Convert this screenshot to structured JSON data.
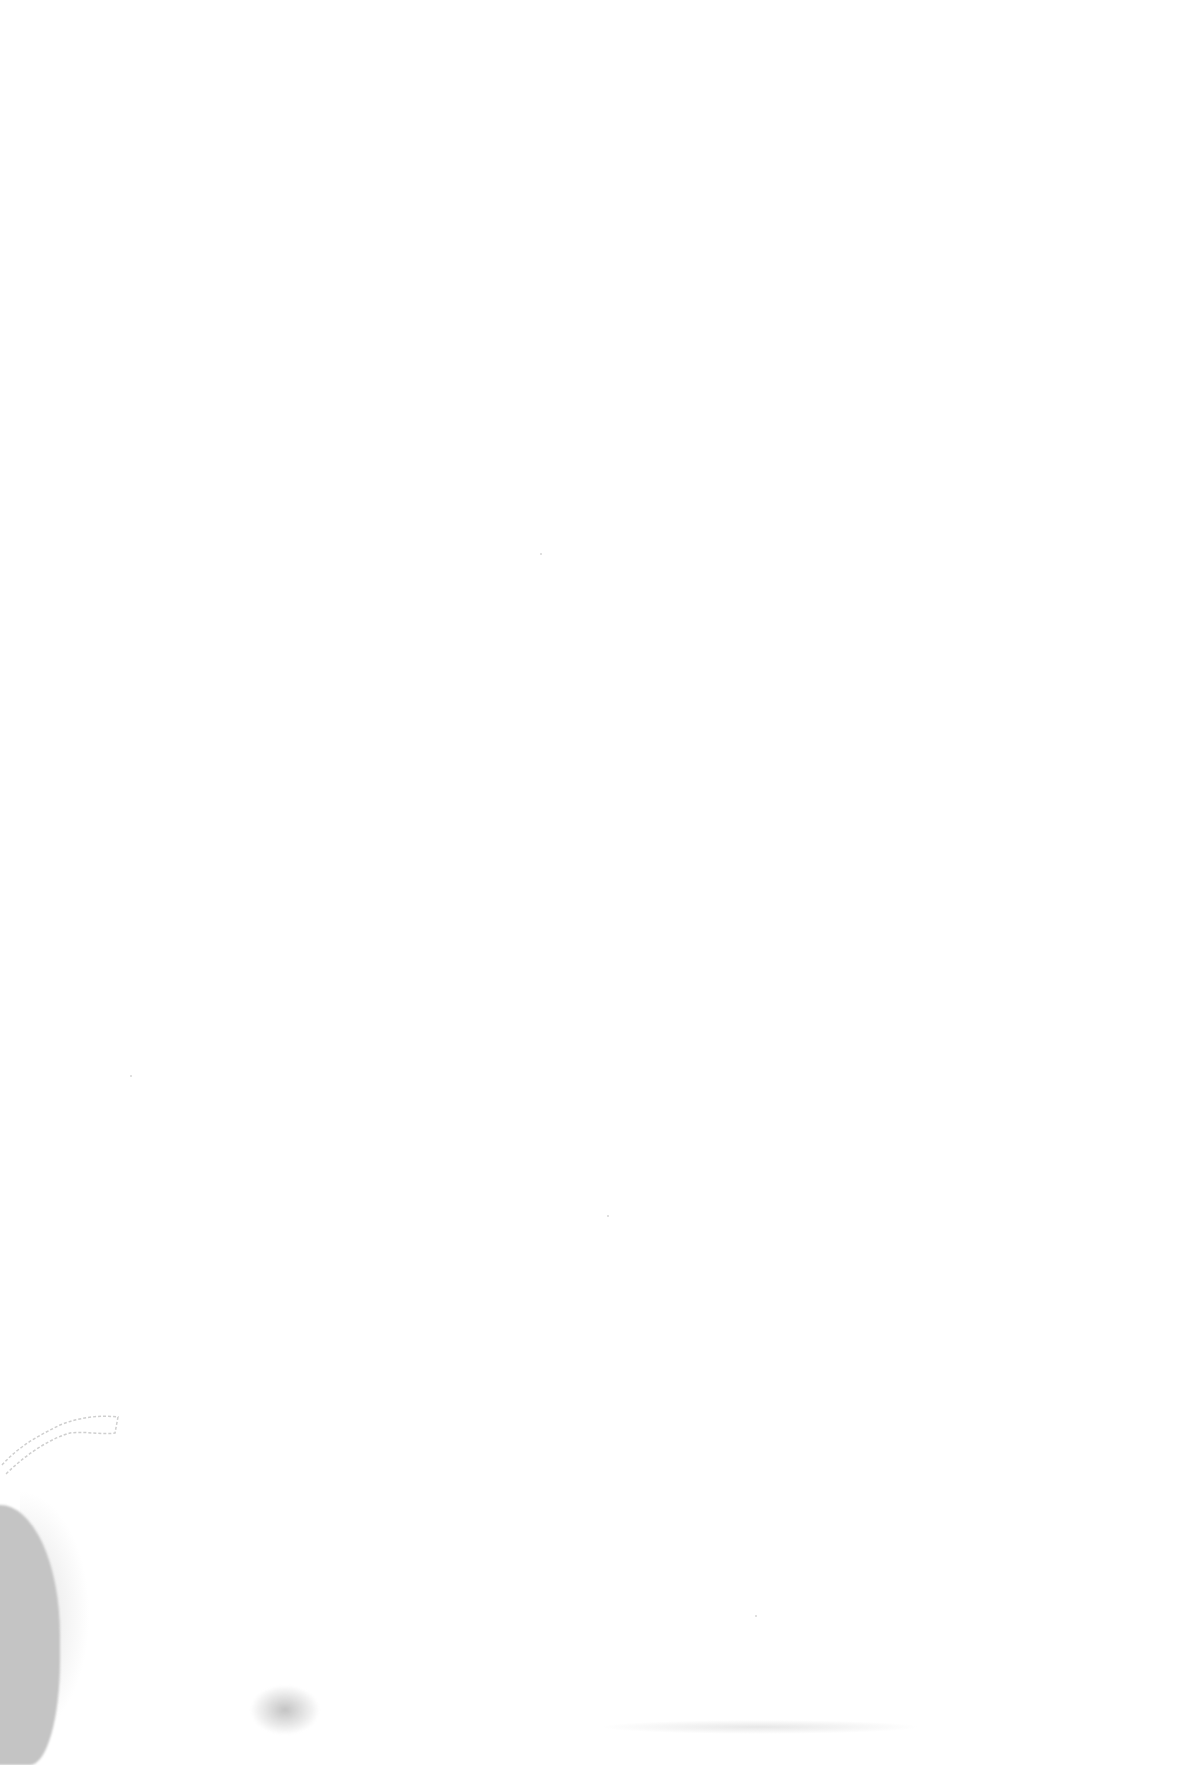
{
  "page": {
    "type": "blank-scanned-page",
    "background_color": "#ffffff",
    "artifact_color": "#c4c4c4",
    "text": ""
  }
}
